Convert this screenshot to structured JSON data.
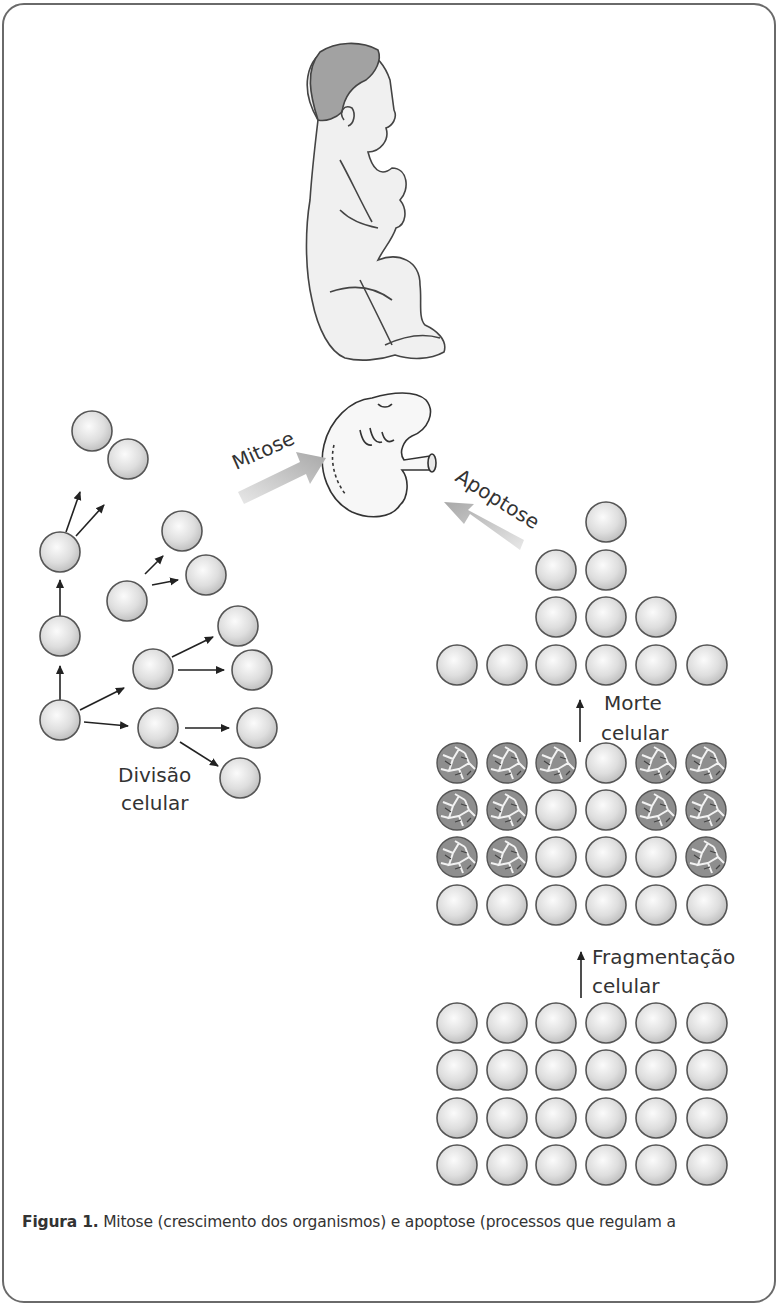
{
  "figure": {
    "process_labels": {
      "mitosis": "Mitose",
      "apoptosis": "Apoptose"
    },
    "stage_labels": {
      "cell_division_line1": "Divisão",
      "cell_division_line2": "celular",
      "cell_death_line1": "Morte",
      "cell_death_line2": "celular",
      "fragmentation_line1": "Fragmentação",
      "fragmentation_line2": "celular"
    },
    "illustrations": [
      "baby-fetus",
      "embryo"
    ],
    "colors": {
      "cell_fill": "#e6e6e6",
      "cell_stroke": "#555555",
      "fragmented_fill": "#8c8c8c",
      "hair": "#9a9a9a",
      "arrow_gradient_start": "#d6d6d6",
      "arrow_gradient_end": "#9e9e9e"
    }
  },
  "caption": {
    "label": "Figura 1.",
    "text": " Mitose (crescimento dos organismos) e apoptose (processos que regulam a"
  }
}
